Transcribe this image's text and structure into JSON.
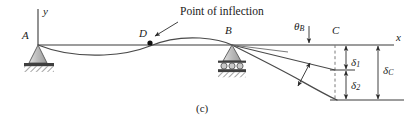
{
  "figure": {
    "caption": "(c)",
    "annotation": "Point of inflection",
    "labels": {
      "support_a": "A",
      "point_d": "D",
      "support_b": "B",
      "point_c": "C",
      "axis_y": "y",
      "axis_x": "x",
      "theta_b": "θ",
      "theta_b_sub": "B",
      "delta_1": "δ",
      "delta_1_sub": "1",
      "delta_2": "δ",
      "delta_2_sub": "2",
      "delta_c": "δ",
      "delta_c_sub": "C"
    },
    "colors": {
      "line": "#3a3a3a",
      "text": "#1a1a1a",
      "support_fill": "#c9c9c9",
      "hatch": "#5a5a5a",
      "background": "#ffffff"
    },
    "geometry": {
      "axis_y_px": 45,
      "support_a_x_px": 38,
      "inflection_d_x_px": 150,
      "support_b_x_px": 232,
      "point_c_x_px": 335,
      "axis_right_x_px": 395,
      "delta_1_bottom_y_px": 70,
      "delta_2_bottom_y_px": 100
    }
  }
}
